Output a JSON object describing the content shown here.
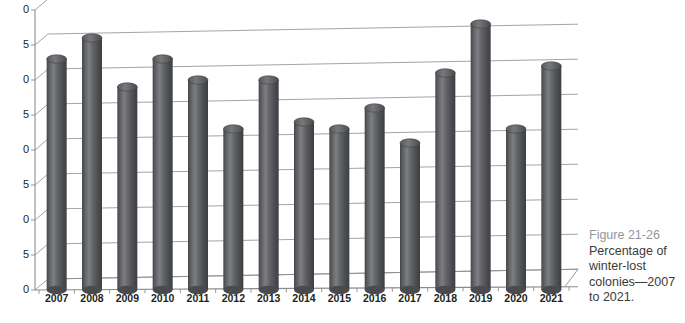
{
  "figure": {
    "number_label": "Figure 21-26",
    "caption_text": "Percentage of winter-lost colonies—2007 to 2021."
  },
  "colors": {
    "bar_fill": "#58595b",
    "bar_highlight": "#8d8f91",
    "bar_shadow": "#3f4042",
    "gridline": "#9a9a9a",
    "axis": "#8c8c8c",
    "tick_text": "#231f20",
    "caption_number": "#939598",
    "caption_body": "#3b3b3b",
    "background": "#ffffff"
  },
  "chart_data": {
    "type": "bar",
    "title": "",
    "subtitle": "",
    "xlabel": "",
    "ylabel": "",
    "categories": [
      "2007",
      "2008",
      "2009",
      "2010",
      "2011",
      "2012",
      "2013",
      "2014",
      "2015",
      "2016",
      "2017",
      "2018",
      "2019",
      "2020",
      "2021"
    ],
    "values": [
      33,
      36,
      29,
      33,
      30,
      23,
      30,
      24,
      23,
      26,
      21,
      31,
      38,
      23,
      32
    ],
    "series": [
      {
        "name": "Percentage of winter-lost colonies",
        "values": [
          33,
          36,
          29,
          33,
          30,
          23,
          30,
          24,
          23,
          26,
          21,
          31,
          38,
          23,
          32
        ]
      }
    ],
    "ylim": [
      0,
      40
    ],
    "ytick_values": [
      0,
      5,
      10,
      15,
      20,
      25,
      30,
      35,
      40
    ],
    "ytick_labels": [
      "0",
      "5",
      "10",
      "15",
      "20",
      "25",
      "30",
      "35",
      "40"
    ],
    "ytick_labels_visible": [
      "0",
      "5",
      "0",
      "5",
      "0",
      "5",
      "0",
      "5",
      "0"
    ],
    "grid": true,
    "legend": "none",
    "style": "3d-cylinder"
  }
}
